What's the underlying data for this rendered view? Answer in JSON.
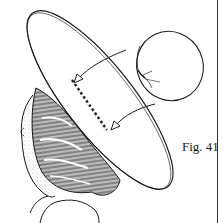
{
  "figure": {
    "caption": "Fig. 41",
    "colors": {
      "ink": "#1a1a1a",
      "paper": "#ffffff"
    },
    "elements": [
      {
        "name": "hat-brim",
        "type": "ellipse"
      },
      {
        "name": "hair-bun",
        "type": "hatched-shape"
      },
      {
        "name": "head-profile",
        "type": "outline"
      },
      {
        "name": "padded-roll",
        "type": "circle-with-ties"
      },
      {
        "name": "stitch-line",
        "type": "dashed-line"
      },
      {
        "name": "arrow-upper",
        "type": "arrow"
      },
      {
        "name": "arrow-lower",
        "type": "arrow"
      }
    ]
  }
}
